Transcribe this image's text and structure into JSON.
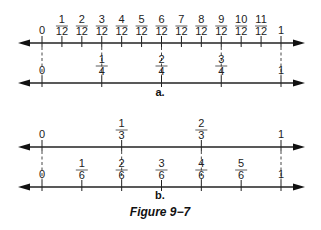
{
  "figure": {
    "caption": "Figure 9−7",
    "parts": [
      {
        "label": "a.",
        "lines": [
          {
            "name": "twelfths",
            "ticks": [
              {
                "num": "0",
                "den": ""
              },
              {
                "num": "1",
                "den": "12"
              },
              {
                "num": "2",
                "den": "12"
              },
              {
                "num": "3",
                "den": "12"
              },
              {
                "num": "4",
                "den": "12"
              },
              {
                "num": "5",
                "den": "12"
              },
              {
                "num": "6",
                "den": "12"
              },
              {
                "num": "7",
                "den": "12"
              },
              {
                "num": "8",
                "den": "12"
              },
              {
                "num": "9",
                "den": "12"
              },
              {
                "num": "10",
                "den": "12"
              },
              {
                "num": "11",
                "den": "12"
              },
              {
                "num": "1",
                "den": ""
              }
            ]
          },
          {
            "name": "fourths",
            "ticks": [
              {
                "num": "0",
                "den": ""
              },
              {
                "num": "1",
                "den": "4"
              },
              {
                "num": "2",
                "den": "4"
              },
              {
                "num": "3",
                "den": "4"
              },
              {
                "num": "1",
                "den": ""
              }
            ]
          }
        ]
      },
      {
        "label": "b.",
        "lines": [
          {
            "name": "thirds",
            "ticks": [
              {
                "num": "0",
                "den": ""
              },
              {
                "num": "1",
                "den": "3"
              },
              {
                "num": "2",
                "den": "3"
              },
              {
                "num": "1",
                "den": ""
              }
            ]
          },
          {
            "name": "sixths",
            "ticks": [
              {
                "num": "0",
                "den": ""
              },
              {
                "num": "1",
                "den": "6"
              },
              {
                "num": "2",
                "den": "6"
              },
              {
                "num": "3",
                "den": "6"
              },
              {
                "num": "4",
                "den": "6"
              },
              {
                "num": "5",
                "den": "6"
              },
              {
                "num": "1",
                "den": ""
              }
            ]
          }
        ]
      }
    ]
  }
}
